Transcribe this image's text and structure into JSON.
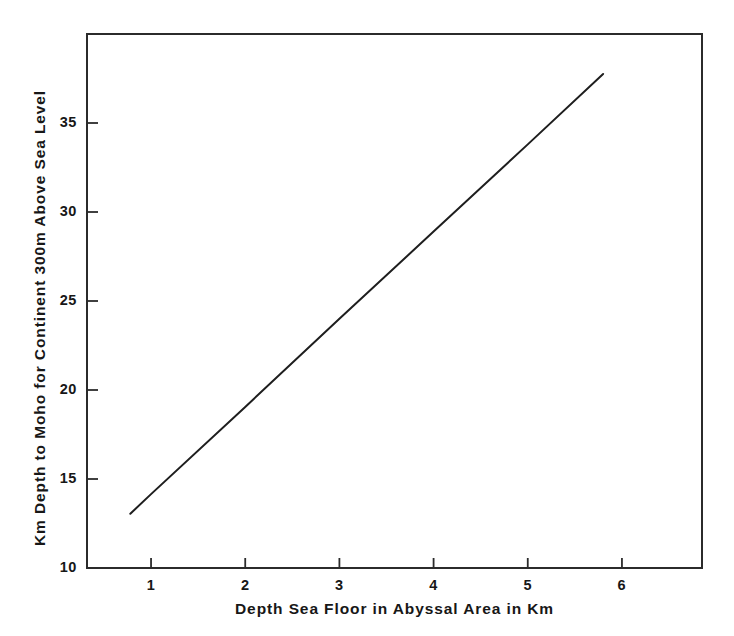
{
  "chart_data": {
    "type": "line",
    "title": "",
    "xlabel": "Depth Sea Floor in Abyssal Area in Km",
    "ylabel": "Km Depth to Moho for Continent 300m Above Sea Level",
    "xlim": [
      0.32,
      6.85
    ],
    "ylim": [
      10.0,
      40.0
    ],
    "xticks": [
      1,
      2,
      3,
      4,
      5,
      6
    ],
    "xtick_labels": [
      "1",
      "2",
      "3",
      "4",
      "5",
      "6"
    ],
    "yticks": [
      10,
      15,
      20,
      25,
      30,
      35
    ],
    "ytick_labels": [
      "10",
      "15",
      "20",
      "25",
      "30",
      "35"
    ],
    "grid": false,
    "legend": null,
    "series": [
      {
        "name": "Moho depth vs abyssal sea floor depth",
        "color": "#1e1e1e",
        "line_width": 2,
        "x": [
          0.78,
          1.0,
          2.0,
          3.0,
          4.0,
          5.0,
          5.8
        ],
        "y": [
          13.05,
          14.15,
          19.05,
          24.0,
          28.9,
          33.8,
          37.75
        ]
      }
    ],
    "annotations": []
  },
  "axis": {
    "frame_color": "#2b2b2b",
    "tick_color": "#2b2b2b",
    "background": "#ffffff"
  }
}
